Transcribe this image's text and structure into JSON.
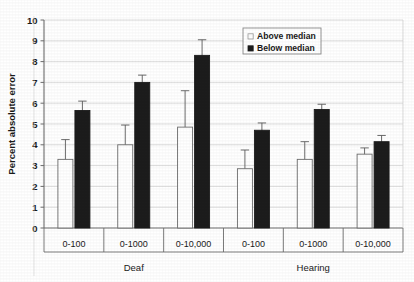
{
  "chart_data": {
    "type": "bar",
    "title": "",
    "subtitle": "",
    "xlabel": "",
    "ylabel": "Percent absolute error",
    "ylim": [
      0,
      10
    ],
    "ytick_values": [
      0,
      1,
      2,
      3,
      4,
      5,
      6,
      7,
      8,
      9,
      10
    ],
    "ytick_labels": [
      "0",
      "1",
      "2",
      "3",
      "4",
      "5",
      "6",
      "7",
      "8",
      "9",
      "10"
    ],
    "grid": "horizontal",
    "legend_position": "top-right",
    "categories": [
      "0-100",
      "0-1000",
      "0-10,000",
      "0-100",
      "0-1000",
      "0-10,000"
    ],
    "group_labels": [
      "Deaf",
      "Hearing"
    ],
    "groups": [
      {
        "name": "Deaf",
        "categories": [
          "0-100",
          "0-1000",
          "0-10,000"
        ]
      },
      {
        "name": "Hearing",
        "categories": [
          "0-100",
          "0-1000",
          "0-10,000"
        ]
      }
    ],
    "series": [
      {
        "name": "Above median",
        "fill": "#ffffff",
        "edge": "#6d6d6d",
        "values": [
          3.3,
          4.0,
          4.85,
          2.85,
          3.3,
          3.55
        ],
        "errors": [
          0.95,
          0.95,
          1.75,
          0.9,
          0.85,
          0.3
        ]
      },
      {
        "name": "Below median",
        "fill": "#1c1c1c",
        "edge": "#1c1c1c",
        "values": [
          5.65,
          7.0,
          8.3,
          4.7,
          5.7,
          4.15
        ],
        "errors": [
          0.45,
          0.35,
          0.75,
          0.35,
          0.25,
          0.3
        ]
      }
    ],
    "legend": [
      {
        "label": "Above median",
        "marker": "open-square"
      },
      {
        "label": "Below median",
        "marker": "filled-square"
      }
    ],
    "colors": {
      "above_median": "#ffffff",
      "below_median": "#1c1c1c",
      "axis": "#6d6d6d",
      "grid": "#d4d4d4",
      "text": "#1a1a1a",
      "background": "#ffffff"
    }
  },
  "alt_text": "Grouped bar chart of percent absolute error for Deaf and Hearing participants across number ranges 0-100, 0-1000 and 0-10,000, comparing Above median and Below median groups with error bars."
}
